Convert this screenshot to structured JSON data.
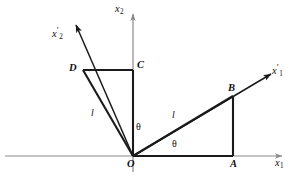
{
  "figure": {
    "background_color": "#ffffff",
    "axis_color": "#8a8a8a",
    "line_color": "#111111"
  },
  "axes": [
    {
      "id": "x1",
      "name": "x1-axis",
      "label_base": "x",
      "label_sub": "1",
      "label_prime": "",
      "description": "horizontal original axis, arrow to the right"
    },
    {
      "id": "x2",
      "name": "x2-axis",
      "label_base": "x",
      "label_sub": "2",
      "label_prime": "",
      "description": "vertical original axis, arrow upward"
    },
    {
      "id": "x1p",
      "name": "x1-prime-axis",
      "label_base": "x",
      "label_sub": "1",
      "label_prime": "′",
      "description": "rotated axis, arrow to upper right through B"
    },
    {
      "id": "x2p",
      "name": "x2-prime-axis",
      "label_base": "x",
      "label_sub": "2",
      "label_prime": "′",
      "description": "rotated axis, arrow to upper left through D"
    }
  ],
  "points": [
    {
      "id": "O",
      "label": "O",
      "desc": "origin"
    },
    {
      "id": "A",
      "label": "A",
      "desc": "foot of perpendicular on x1 axis"
    },
    {
      "id": "B",
      "label": "B",
      "desc": "point on rotated x1-prime axis"
    },
    {
      "id": "C",
      "label": "C",
      "desc": "point on x2 axis"
    },
    {
      "id": "D",
      "label": "D",
      "desc": "point on rotated x2-prime axis"
    }
  ],
  "segments": [
    {
      "id": "OB",
      "label": "l",
      "desc": "hypotenuse from O to B, length l"
    },
    {
      "id": "OD",
      "label": "l",
      "desc": "hypotenuse from O to D, length l"
    },
    {
      "id": "OA",
      "label": "",
      "desc": "horizontal leg from O to A"
    },
    {
      "id": "AB",
      "label": "",
      "desc": "vertical leg from A to B"
    },
    {
      "id": "DC",
      "label": "",
      "desc": "horizontal leg from D to C"
    },
    {
      "id": "CO",
      "label": "",
      "desc": "vertical leg from C down to O"
    }
  ],
  "angles": [
    {
      "id": "theta-right",
      "label": "θ",
      "desc": "angle between x1 axis and OB"
    },
    {
      "id": "theta-left",
      "label": "θ",
      "desc": "angle between x2 axis and OD"
    }
  ],
  "lengths": {
    "l_right": "l",
    "l_left": "l"
  }
}
